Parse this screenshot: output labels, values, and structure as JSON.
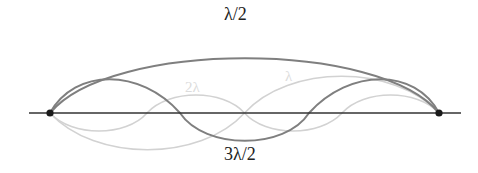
{
  "diagram": {
    "labels": {
      "half_wavelength": "λ/2",
      "three_half_wavelength": "3λ/2",
      "two_wavelength": "2λ",
      "one_wavelength": "λ"
    },
    "colors": {
      "axis": "#333333",
      "node": "#1a1a1a",
      "primary_curve": "#7f7f7f",
      "faint_curve": "#d2d2d2",
      "faint_label": "#dcdcdc",
      "label": "#222222"
    },
    "nodes": [
      {
        "x": 50,
        "y": 113
      },
      {
        "x": 439,
        "y": 113
      }
    ]
  }
}
